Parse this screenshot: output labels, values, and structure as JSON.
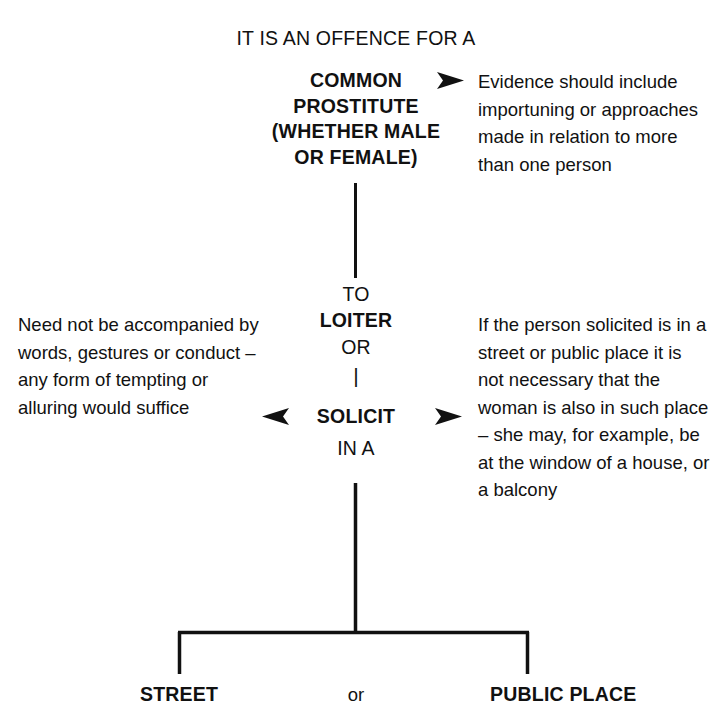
{
  "heading": "IT IS AN OFFENCE FOR A",
  "subject": {
    "lines": [
      "COMMON",
      "PROSTITUTE",
      "(WHETHER MALE",
      "OR FEMALE)"
    ]
  },
  "centre": {
    "to": "TO",
    "loiter": "LOITER",
    "or": "OR",
    "divider": "|",
    "solicit": "SOLICIT",
    "in_a": "IN A"
  },
  "annotations": {
    "top_right": "Evidence should include importuning or approaches made in relation to more than one person",
    "middle_left": "Need not be accompanied by words, gestures or conduct – any form of tempting or alluring would suffice",
    "middle_right": "If the person solicited is in a street or public place it is not necessary that the woman is also in such place – she may, for example, be at the window of a house, or a balcony"
  },
  "leaves": {
    "street": "STREET",
    "conjunction": "or",
    "public_place": "PUBLIC PLACE"
  },
  "style": {
    "ink": "#111111",
    "paper": "#ffffff"
  }
}
